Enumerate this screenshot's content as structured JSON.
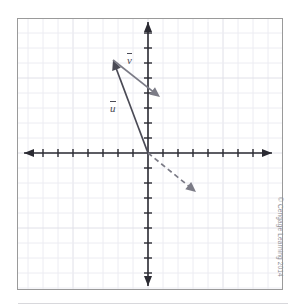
{
  "figure": {
    "credit": "© Cengage Learning 2014"
  },
  "labels": {
    "vector_v": "v",
    "vector_u": "u"
  },
  "colors": {
    "axis": "#2b2b33",
    "grid_minor": "#ececf2",
    "grid_major": "#e0e0e8",
    "frame": "#9a9a9a",
    "vector_u": "#4a4a55",
    "vector_v": "#7b7b86",
    "vector_dashed": "#7b7b86",
    "credit_text": "#8d8d93",
    "background": "#ffffff"
  },
  "chart_data": {
    "type": "scatter",
    "title": "",
    "xlabel": "",
    "ylabel": "",
    "grid": true,
    "legend": null,
    "origin_px": {
      "x": 148,
      "y": 153
    },
    "unit_px": 15,
    "xlim": [
      -8.7,
      8.3
    ],
    "ylim": [
      -8.7,
      9.0
    ],
    "x_ticks": [
      -8,
      -7,
      -6,
      -5,
      -4,
      -3,
      -2,
      -1,
      1,
      2,
      3,
      4,
      5,
      6,
      7,
      8
    ],
    "y_ticks": [
      -8,
      -7,
      -6,
      -5,
      -4,
      -3,
      -2,
      -1,
      1,
      2,
      3,
      4,
      5,
      6,
      7,
      8
    ],
    "tick_labels_shown": false,
    "vectors": [
      {
        "name": "u",
        "label": "u",
        "style": "solid",
        "color": "#4a4a55",
        "tail": {
          "x": 0,
          "y": 0
        },
        "head": {
          "x": -2.3,
          "y": 6.2
        },
        "tail_px": {
          "x": 148,
          "y": 153
        },
        "head_px": {
          "x": 113,
          "y": 60
        },
        "label_px": {
          "x": 110,
          "y": 101
        }
      },
      {
        "name": "v",
        "label": "v",
        "style": "solid",
        "color": "#7b7b86",
        "tail": {
          "x": -2.3,
          "y": 6.2
        },
        "head": {
          "x": 0.8,
          "y": 3.7
        },
        "tail_px": {
          "x": 113,
          "y": 60
        },
        "head_px": {
          "x": 160,
          "y": 97
        },
        "label_px": {
          "x": 127,
          "y": 53
        }
      },
      {
        "name": "resultant",
        "label": "",
        "style": "dashed",
        "color": "#7b7b86",
        "tail": {
          "x": 0,
          "y": 0
        },
        "head": {
          "x": 3.1,
          "y": -2.5
        },
        "tail_px": {
          "x": 148,
          "y": 153
        },
        "head_px": {
          "x": 196,
          "y": 192
        },
        "label_px": null
      }
    ]
  }
}
